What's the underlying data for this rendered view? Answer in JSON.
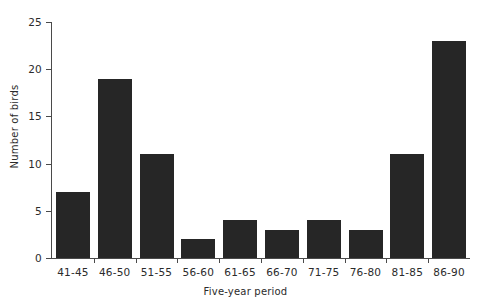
{
  "chart_data": {
    "type": "bar",
    "title": "",
    "xlabel": "Five-year period",
    "ylabel": "Number of birds",
    "categories": [
      "41-45",
      "46-50",
      "51-55",
      "56-60",
      "61-65",
      "66-70",
      "71-75",
      "76-80",
      "81-85",
      "86-90"
    ],
    "values": [
      7,
      19,
      11,
      2,
      4,
      3,
      4,
      3,
      11,
      23
    ],
    "series": [
      {
        "name": "Number of birds",
        "values": [
          7,
          19,
          11,
          2,
          4,
          3,
          4,
          3,
          11,
          23
        ]
      }
    ],
    "ylim": [
      0,
      25
    ],
    "yticks": [
      0,
      5,
      10,
      15,
      20,
      25
    ],
    "ytick_labels": [
      "0",
      "5",
      "10",
      "15",
      "20",
      "25"
    ],
    "grid": false,
    "legend": false,
    "legend_position": "none",
    "bar_color": "#262626",
    "axis_color": "#4a4a4a",
    "background_color": "#ffffff"
  }
}
